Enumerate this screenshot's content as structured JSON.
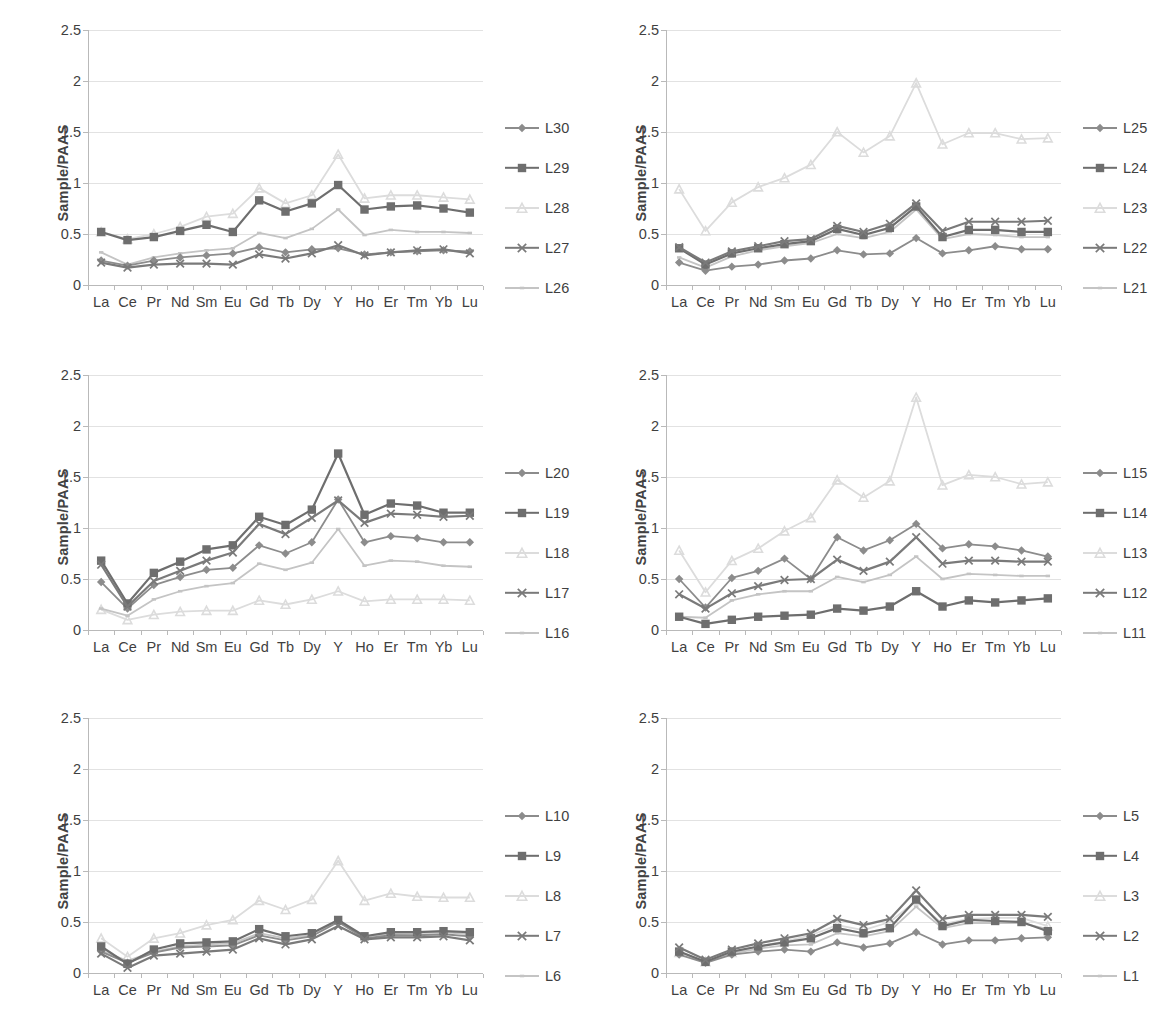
{
  "figure": {
    "layout": "2 columns x 3 rows of line charts",
    "panel_count": 6,
    "shared_ylabel": "Sample/PAAS",
    "shared_categories": [
      "La",
      "Ce",
      "Pr",
      "Nd",
      "Sm",
      "Eu",
      "Gd",
      "Tb",
      "Dy",
      "Y",
      "Ho",
      "Er",
      "Tm",
      "Yb",
      "Lu"
    ],
    "shared_yticks": [
      "0",
      "0.5",
      "1",
      "1.5",
      "2",
      "2.5"
    ],
    "ylim": [
      0,
      2.5
    ],
    "grid": "horizontal gridlines at every 0.5",
    "legend_position": "right of each panel"
  },
  "colors": {
    "diamond_series": "#8c8c8c",
    "square_series": "#6e6e6e",
    "triangle_series": "#dcdcdc",
    "cross_series": "#7a7a7a",
    "line_series": "#c4c4c4",
    "gridline": "#e2e2e2",
    "axis": "#b9b9b9",
    "text": "#3f3f3f",
    "background": "#ffffff"
  },
  "chart_data": [
    {
      "type": "line",
      "panel": "top-left",
      "title": "",
      "xlabel": "",
      "ylabel": "Sample/PAAS",
      "ylim": [
        0,
        2.5
      ],
      "yticks": [
        0,
        0.5,
        1,
        1.5,
        2,
        2.5
      ],
      "grid": true,
      "legend": "right",
      "categories": [
        "La",
        "Ce",
        "Pr",
        "Nd",
        "Sm",
        "Eu",
        "Gd",
        "Tb",
        "Dy",
        "Y",
        "Ho",
        "Er",
        "Tm",
        "Yb",
        "Lu"
      ],
      "series": [
        {
          "name": "L30",
          "marker": "diamond",
          "color": "#8c8c8c",
          "values": [
            0.24,
            0.19,
            0.24,
            0.27,
            0.29,
            0.31,
            0.37,
            0.32,
            0.35,
            0.36,
            0.3,
            0.32,
            0.33,
            0.34,
            0.33
          ]
        },
        {
          "name": "L29",
          "marker": "square",
          "color": "#6e6e6e",
          "values": [
            0.52,
            0.44,
            0.47,
            0.53,
            0.59,
            0.52,
            0.83,
            0.72,
            0.8,
            0.98,
            0.74,
            0.77,
            0.78,
            0.75,
            0.71
          ]
        },
        {
          "name": "L28",
          "marker": "triangle",
          "color": "#dcdcdc",
          "values": [
            0.52,
            0.45,
            0.5,
            0.57,
            0.67,
            0.7,
            0.95,
            0.8,
            0.88,
            1.28,
            0.85,
            0.88,
            0.88,
            0.86,
            0.84
          ]
        },
        {
          "name": "L27",
          "marker": "cross",
          "color": "#7a7a7a",
          "values": [
            0.22,
            0.17,
            0.2,
            0.21,
            0.21,
            0.2,
            0.3,
            0.26,
            0.31,
            0.39,
            0.29,
            0.32,
            0.34,
            0.35,
            0.31
          ]
        },
        {
          "name": "L26",
          "marker": "line",
          "color": "#c4c4c4",
          "values": [
            0.32,
            0.2,
            0.27,
            0.31,
            0.34,
            0.36,
            0.51,
            0.46,
            0.55,
            0.74,
            0.49,
            0.54,
            0.52,
            0.52,
            0.51
          ]
        }
      ]
    },
    {
      "type": "line",
      "panel": "top-right",
      "title": "",
      "xlabel": "",
      "ylabel": "Sample/PAAS",
      "ylim": [
        0,
        2.5
      ],
      "yticks": [
        0,
        0.5,
        1,
        1.5,
        2,
        2.5
      ],
      "grid": true,
      "legend": "right",
      "categories": [
        "La",
        "Ce",
        "Pr",
        "Nd",
        "Sm",
        "Eu",
        "Gd",
        "Tb",
        "Dy",
        "Y",
        "Ho",
        "Er",
        "Tm",
        "Yb",
        "Lu"
      ],
      "series": [
        {
          "name": "L25",
          "marker": "diamond",
          "color": "#8c8c8c",
          "values": [
            0.22,
            0.14,
            0.18,
            0.2,
            0.24,
            0.26,
            0.34,
            0.3,
            0.31,
            0.46,
            0.31,
            0.34,
            0.38,
            0.35,
            0.35
          ]
        },
        {
          "name": "L24",
          "marker": "square",
          "color": "#6e6e6e",
          "values": [
            0.36,
            0.2,
            0.31,
            0.36,
            0.4,
            0.43,
            0.55,
            0.49,
            0.56,
            0.77,
            0.47,
            0.54,
            0.54,
            0.52,
            0.52
          ]
        },
        {
          "name": "L23",
          "marker": "triangle",
          "color": "#dcdcdc",
          "values": [
            0.94,
            0.53,
            0.81,
            0.96,
            1.05,
            1.18,
            1.5,
            1.3,
            1.46,
            1.98,
            1.38,
            1.49,
            1.49,
            1.43,
            1.44
          ]
        },
        {
          "name": "L22",
          "marker": "cross",
          "color": "#7a7a7a",
          "values": [
            0.37,
            0.22,
            0.33,
            0.38,
            0.43,
            0.45,
            0.58,
            0.52,
            0.6,
            0.8,
            0.53,
            0.62,
            0.62,
            0.62,
            0.63
          ]
        },
        {
          "name": "L21",
          "marker": "line",
          "color": "#c4c4c4",
          "values": [
            0.27,
            0.17,
            0.28,
            0.34,
            0.38,
            0.41,
            0.5,
            0.46,
            0.52,
            0.74,
            0.45,
            0.5,
            0.49,
            0.47,
            0.47
          ]
        }
      ]
    },
    {
      "type": "line",
      "panel": "middle-left",
      "title": "",
      "xlabel": "",
      "ylabel": "Sample/PAAS",
      "ylim": [
        0,
        2.5
      ],
      "yticks": [
        0,
        0.5,
        1,
        1.5,
        2,
        2.5
      ],
      "grid": true,
      "legend": "right",
      "categories": [
        "La",
        "Ce",
        "Pr",
        "Nd",
        "Sm",
        "Eu",
        "Gd",
        "Tb",
        "Dy",
        "Y",
        "Ho",
        "Er",
        "Tm",
        "Yb",
        "Lu"
      ],
      "series": [
        {
          "name": "L20",
          "marker": "diamond",
          "color": "#8c8c8c",
          "values": [
            0.47,
            0.21,
            0.44,
            0.52,
            0.59,
            0.61,
            0.83,
            0.75,
            0.86,
            1.28,
            0.86,
            0.92,
            0.9,
            0.86,
            0.86
          ]
        },
        {
          "name": "L19",
          "marker": "square",
          "color": "#6e6e6e",
          "values": [
            0.68,
            0.26,
            0.56,
            0.67,
            0.79,
            0.83,
            1.11,
            1.03,
            1.18,
            1.73,
            1.13,
            1.24,
            1.22,
            1.15,
            1.15
          ]
        },
        {
          "name": "L18",
          "marker": "triangle",
          "color": "#dcdcdc",
          "values": [
            0.2,
            0.1,
            0.15,
            0.18,
            0.19,
            0.19,
            0.29,
            0.25,
            0.3,
            0.38,
            0.28,
            0.3,
            0.3,
            0.3,
            0.29
          ]
        },
        {
          "name": "L17",
          "marker": "cross",
          "color": "#7a7a7a",
          "values": [
            0.64,
            0.23,
            0.48,
            0.58,
            0.68,
            0.76,
            1.04,
            0.94,
            1.1,
            1.27,
            1.05,
            1.14,
            1.13,
            1.11,
            1.12
          ]
        },
        {
          "name": "L16",
          "marker": "line",
          "color": "#c4c4c4",
          "values": [
            0.21,
            0.14,
            0.3,
            0.38,
            0.43,
            0.46,
            0.65,
            0.59,
            0.66,
            0.99,
            0.63,
            0.68,
            0.67,
            0.63,
            0.62
          ]
        }
      ]
    },
    {
      "type": "line",
      "panel": "middle-right",
      "title": "",
      "xlabel": "",
      "ylabel": "Sample/PAAS",
      "ylim": [
        0,
        2.5
      ],
      "yticks": [
        0,
        0.5,
        1,
        1.5,
        2,
        2.5
      ],
      "grid": true,
      "legend": "right",
      "categories": [
        "La",
        "Ce",
        "Pr",
        "Nd",
        "Sm",
        "Eu",
        "Gd",
        "Tb",
        "Dy",
        "Y",
        "Ho",
        "Er",
        "Tm",
        "Yb",
        "Lu"
      ],
      "series": [
        {
          "name": "L15",
          "marker": "diamond",
          "color": "#8c8c8c",
          "values": [
            0.5,
            0.22,
            0.51,
            0.58,
            0.7,
            0.5,
            0.91,
            0.78,
            0.88,
            1.04,
            0.8,
            0.84,
            0.82,
            0.78,
            0.72
          ]
        },
        {
          "name": "L14",
          "marker": "square",
          "color": "#6e6e6e",
          "values": [
            0.13,
            0.06,
            0.1,
            0.13,
            0.14,
            0.15,
            0.21,
            0.19,
            0.23,
            0.38,
            0.23,
            0.29,
            0.27,
            0.29,
            0.31
          ]
        },
        {
          "name": "L13",
          "marker": "triangle",
          "color": "#dcdcdc",
          "values": [
            0.78,
            0.37,
            0.68,
            0.8,
            0.97,
            1.1,
            1.47,
            1.3,
            1.46,
            2.28,
            1.42,
            1.52,
            1.5,
            1.43,
            1.45
          ]
        },
        {
          "name": "L12",
          "marker": "cross",
          "color": "#7a7a7a",
          "values": [
            0.35,
            0.21,
            0.36,
            0.43,
            0.49,
            0.5,
            0.69,
            0.58,
            0.67,
            0.91,
            0.65,
            0.68,
            0.68,
            0.67,
            0.67
          ]
        },
        {
          "name": "L11",
          "marker": "line",
          "color": "#c4c4c4",
          "values": [
            0.13,
            0.12,
            0.29,
            0.35,
            0.38,
            0.38,
            0.52,
            0.47,
            0.54,
            0.72,
            0.5,
            0.55,
            0.54,
            0.53,
            0.53
          ]
        }
      ]
    },
    {
      "type": "line",
      "panel": "bottom-left",
      "title": "",
      "xlabel": "",
      "ylabel": "Sample/PAAS",
      "ylim": [
        0,
        2.5
      ],
      "yticks": [
        0,
        0.5,
        1,
        1.5,
        2,
        2.5
      ],
      "grid": true,
      "legend": "right",
      "categories": [
        "La",
        "Ce",
        "Pr",
        "Nd",
        "Sm",
        "Eu",
        "Gd",
        "Tb",
        "Dy",
        "Y",
        "Ho",
        "Er",
        "Tm",
        "Yb",
        "Lu"
      ],
      "series": [
        {
          "name": "L10",
          "marker": "diamond",
          "color": "#8c8c8c",
          "values": [
            0.21,
            0.1,
            0.2,
            0.25,
            0.26,
            0.27,
            0.37,
            0.32,
            0.36,
            0.5,
            0.34,
            0.37,
            0.37,
            0.38,
            0.36
          ]
        },
        {
          "name": "L9",
          "marker": "square",
          "color": "#6e6e6e",
          "values": [
            0.26,
            0.09,
            0.23,
            0.29,
            0.3,
            0.31,
            0.43,
            0.36,
            0.39,
            0.52,
            0.36,
            0.4,
            0.4,
            0.41,
            0.4
          ]
        },
        {
          "name": "L8",
          "marker": "triangle",
          "color": "#dcdcdc",
          "values": [
            0.34,
            0.16,
            0.34,
            0.39,
            0.47,
            0.52,
            0.71,
            0.62,
            0.72,
            1.1,
            0.71,
            0.78,
            0.75,
            0.74,
            0.74
          ]
        },
        {
          "name": "L7",
          "marker": "cross",
          "color": "#7a7a7a",
          "values": [
            0.19,
            0.05,
            0.17,
            0.19,
            0.21,
            0.23,
            0.34,
            0.28,
            0.33,
            0.46,
            0.33,
            0.35,
            0.35,
            0.36,
            0.32
          ]
        },
        {
          "name": "L6",
          "marker": "line",
          "color": "#c4c4c4",
          "values": [
            0.22,
            0.12,
            0.21,
            0.26,
            0.28,
            0.29,
            0.39,
            0.34,
            0.37,
            0.51,
            0.36,
            0.38,
            0.39,
            0.4,
            0.38
          ]
        }
      ]
    },
    {
      "type": "line",
      "panel": "bottom-right",
      "title": "",
      "xlabel": "",
      "ylabel": "Sample/PAAS",
      "ylim": [
        0,
        2.5
      ],
      "yticks": [
        0,
        0.5,
        1,
        1.5,
        2,
        2.5
      ],
      "grid": true,
      "legend": "right",
      "categories": [
        "La",
        "Ce",
        "Pr",
        "Nd",
        "Sm",
        "Eu",
        "Gd",
        "Tb",
        "Dy",
        "Y",
        "Ho",
        "Er",
        "Tm",
        "Yb",
        "Lu"
      ],
      "series": [
        {
          "name": "L5",
          "marker": "diamond",
          "color": "#8c8c8c",
          "values": [
            0.18,
            0.1,
            0.18,
            0.21,
            0.23,
            0.21,
            0.3,
            0.25,
            0.29,
            0.4,
            0.28,
            0.32,
            0.32,
            0.34,
            0.35
          ]
        },
        {
          "name": "L4",
          "marker": "square",
          "color": "#6e6e6e",
          "values": [
            0.21,
            0.11,
            0.21,
            0.26,
            0.3,
            0.34,
            0.44,
            0.39,
            0.44,
            0.72,
            0.46,
            0.52,
            0.51,
            0.5,
            0.41
          ]
        },
        {
          "name": "L3",
          "marker": "triangle",
          "color": "#dcdcdc",
          "values": [
            0.2,
            0.11,
            0.2,
            0.26,
            0.31,
            0.37,
            0.47,
            0.42,
            0.5,
            0.71,
            0.48,
            0.53,
            0.54,
            0.54,
            0.46
          ]
        },
        {
          "name": "L2",
          "marker": "cross",
          "color": "#7a7a7a",
          "values": [
            0.25,
            0.13,
            0.23,
            0.29,
            0.34,
            0.39,
            0.53,
            0.47,
            0.53,
            0.81,
            0.53,
            0.57,
            0.57,
            0.57,
            0.55
          ]
        },
        {
          "name": "L1",
          "marker": "line",
          "color": "#c4c4c4",
          "values": [
            0.21,
            0.11,
            0.19,
            0.24,
            0.27,
            0.28,
            0.39,
            0.36,
            0.41,
            0.65,
            0.44,
            0.49,
            0.49,
            0.49,
            0.43
          ]
        }
      ]
    }
  ]
}
